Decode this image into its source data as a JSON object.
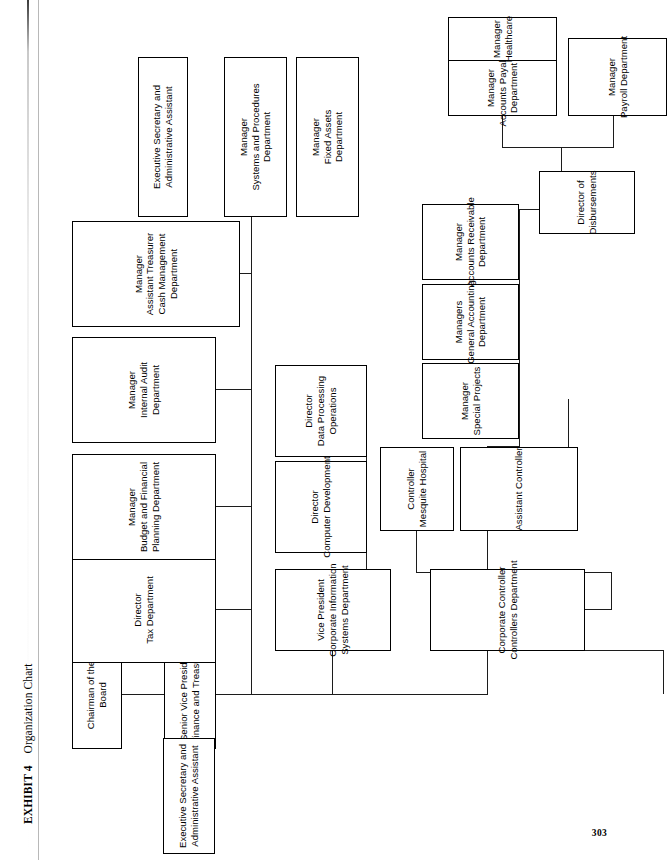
{
  "exhibit": {
    "label": "EXHIBIT 4",
    "title": "Organization Chart"
  },
  "folio": "303",
  "colors": {
    "box_border": "#000000",
    "connector": "#1c1c1c",
    "background": "#ffffff"
  },
  "chart_data": {
    "type": "diagram",
    "diagram_type": "organization-chart",
    "orientation": "rotated-90-ccw",
    "title": "Organization Chart",
    "nodes": [
      {
        "id": "chairman",
        "lines": [
          "Chairman of the",
          "Board"
        ]
      },
      {
        "id": "svp-finance",
        "lines": [
          "Senior Vice President",
          "Finance and Treasurer"
        ]
      },
      {
        "id": "exec-sec-top",
        "lines": [
          "Executive Secretary and",
          "Administrative Assistant"
        ]
      },
      {
        "id": "dir-tax",
        "lines": [
          "Director",
          "Tax Department"
        ]
      },
      {
        "id": "mgr-budget",
        "lines": [
          "Manager",
          "Budget and Financial",
          "Planning Department"
        ]
      },
      {
        "id": "mgr-audit",
        "lines": [
          "Manager",
          "Internal Audit",
          "Department"
        ]
      },
      {
        "id": "mgr-treasurer",
        "lines": [
          "Manager",
          "Assistant Treasurer",
          "Cash Management",
          "Department"
        ]
      },
      {
        "id": "vp-cis",
        "lines": [
          "Vice President",
          "Corporate Information",
          "Systems Department"
        ]
      },
      {
        "id": "dir-compdev",
        "lines": [
          "Director",
          "Computer Development"
        ]
      },
      {
        "id": "dir-dataproc",
        "lines": [
          "Director",
          "Data Processing",
          "Operations"
        ]
      },
      {
        "id": "corp-controller",
        "lines": [
          "Corporate Controller",
          "Controllers Department"
        ]
      },
      {
        "id": "ctrl-mesquite",
        "lines": [
          "Controller",
          "Mesquite Hospital"
        ]
      },
      {
        "id": "asst-controller",
        "lines": [
          "Assistant Controller"
        ]
      },
      {
        "id": "mgr-specproj",
        "lines": [
          "Manager",
          "Special Projects"
        ]
      },
      {
        "id": "mgr-genacct",
        "lines": [
          "Managers",
          "General Accounting",
          "Department"
        ]
      },
      {
        "id": "mgr-ar",
        "lines": [
          "Manager",
          "Accounts Receivable",
          "Department"
        ]
      },
      {
        "id": "dir-disburse",
        "lines": [
          "Director of",
          "Disbursements"
        ]
      },
      {
        "id": "mgr-ap",
        "lines": [
          "Manager",
          "Accounts Payable",
          "Department"
        ]
      },
      {
        "id": "mgr-healthcare",
        "lines": [
          "Manager",
          "Healthcare"
        ]
      },
      {
        "id": "mgr-payroll",
        "lines": [
          "Manager",
          "Payroll Department"
        ]
      },
      {
        "id": "exec-sec-bottom",
        "lines": [
          "Executive Secretary and",
          "Administrative Assistant"
        ]
      },
      {
        "id": "mgr-systems",
        "lines": [
          "Manager",
          "Systems and Procedures",
          "Department"
        ]
      },
      {
        "id": "mgr-fixedassets",
        "lines": [
          "Manager",
          "Fixed Assets",
          "Department"
        ]
      }
    ],
    "edges": [
      {
        "from": "chairman",
        "to": "svp-finance"
      },
      {
        "from": "svp-finance",
        "to": "exec-sec-top"
      },
      {
        "from": "svp-finance",
        "to": "dir-tax"
      },
      {
        "from": "svp-finance",
        "to": "mgr-budget"
      },
      {
        "from": "svp-finance",
        "to": "mgr-audit"
      },
      {
        "from": "svp-finance",
        "to": "mgr-treasurer"
      },
      {
        "from": "svp-finance",
        "to": "vp-cis"
      },
      {
        "from": "svp-finance",
        "to": "corp-controller"
      },
      {
        "from": "vp-cis",
        "to": "dir-compdev"
      },
      {
        "from": "vp-cis",
        "to": "dir-dataproc"
      },
      {
        "from": "corp-controller",
        "to": "ctrl-mesquite"
      },
      {
        "from": "corp-controller",
        "to": "asst-controller"
      },
      {
        "from": "corp-controller",
        "to": "exec-sec-bottom"
      },
      {
        "from": "corp-controller",
        "to": "mgr-systems"
      },
      {
        "from": "corp-controller",
        "to": "mgr-fixedassets"
      },
      {
        "from": "asst-controller",
        "to": "mgr-specproj"
      },
      {
        "from": "asst-controller",
        "to": "mgr-genacct"
      },
      {
        "from": "asst-controller",
        "to": "mgr-ar"
      },
      {
        "from": "asst-controller",
        "to": "dir-disburse"
      },
      {
        "from": "dir-disburse",
        "to": "mgr-ap"
      },
      {
        "from": "dir-disburse",
        "to": "mgr-healthcare"
      },
      {
        "from": "dir-disburse",
        "to": "mgr-payroll"
      }
    ]
  }
}
